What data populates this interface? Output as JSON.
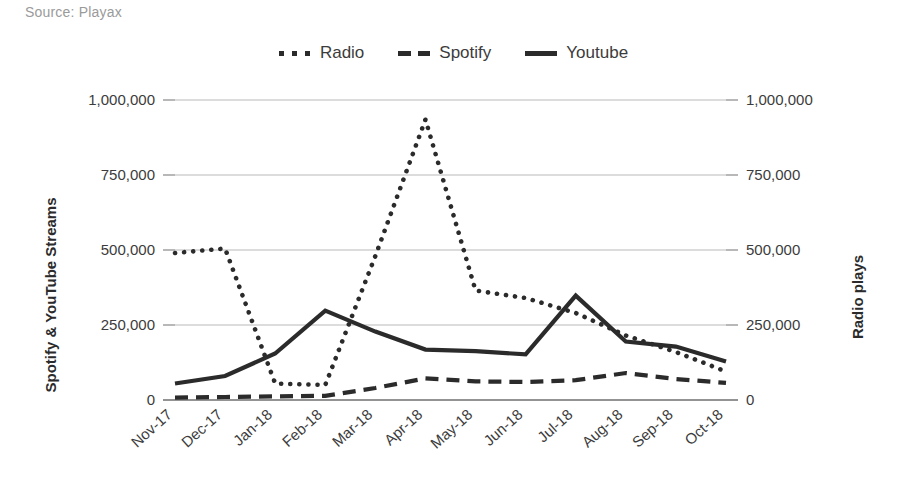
{
  "source_note": "Source: Playax",
  "colors": {
    "ink": "#2b2b2b",
    "grid": "#b9b9b9",
    "axis": "#6f6f6f",
    "muted_text": "#9a9a9a"
  },
  "legend": {
    "position": "top-center",
    "items": [
      {
        "label": "Radio",
        "style": "dotted",
        "swatch": "radio-legend-swatch"
      },
      {
        "label": "Spotify",
        "style": "dashed",
        "swatch": "spotify-legend-swatch"
      },
      {
        "label": "Youtube",
        "style": "solid",
        "swatch": "youtube-legend-swatch"
      }
    ]
  },
  "axes": {
    "left_title": "Spotify & YouTube Streams",
    "right_title": "Radio plays",
    "left_ticks": [
      "0",
      "250,000",
      "500,000",
      "750,000",
      "1,000,000"
    ],
    "right_ticks": [
      "0",
      "250,000",
      "500,000",
      "750,000",
      "1,000,000"
    ]
  },
  "chart_data": {
    "type": "line",
    "title": "",
    "subtitle": "",
    "xlabel": "",
    "ylabel": "Spotify & YouTube Streams",
    "y2label": "Radio plays",
    "ylim": [
      0,
      1000000
    ],
    "y2lim": [
      0,
      1000000
    ],
    "yticks": [
      0,
      250000,
      500000,
      750000,
      1000000
    ],
    "y2ticks": [
      0,
      250000,
      500000,
      750000,
      1000000
    ],
    "grid": true,
    "legend_position": "top-center",
    "categories": [
      "Nov-17",
      "Dec-17",
      "Jan-18",
      "Feb-18",
      "Mar-18",
      "Apr-18",
      "May-18",
      "Jun-18",
      "Jul-18",
      "Aug-18",
      "Sep-18",
      "Oct-18"
    ],
    "series": [
      {
        "name": "Radio",
        "axis": "right",
        "style": "dotted",
        "values": [
          490000,
          505000,
          55000,
          50000,
          480000,
          935000,
          365000,
          340000,
          290000,
          215000,
          160000,
          95000
        ]
      },
      {
        "name": "Spotify",
        "axis": "left",
        "style": "dashed",
        "values": [
          8000,
          10000,
          12000,
          14000,
          40000,
          72000,
          62000,
          60000,
          66000,
          90000,
          70000,
          57000
        ]
      },
      {
        "name": "Youtube",
        "axis": "left",
        "style": "solid",
        "values": [
          55000,
          80000,
          155000,
          298000,
          228000,
          168000,
          163000,
          152000,
          348000,
          195000,
          178000,
          128000
        ]
      }
    ]
  }
}
